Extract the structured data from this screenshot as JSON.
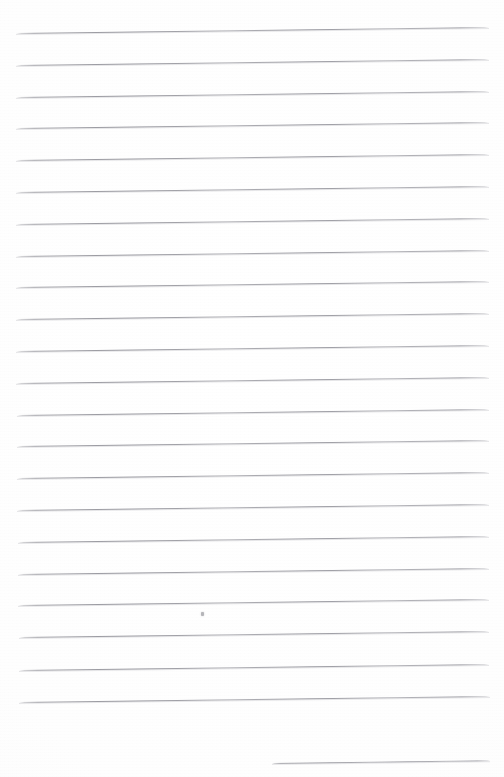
{
  "document": {
    "kind": "scanned-ruled-notebook-page",
    "title": "Blank lined notebook page",
    "description": "Scanned sheet of blank ruled (lined) notebook paper with no handwriting or printed text.",
    "page_width": 504,
    "page_height": 777,
    "background_color": "#ffffff",
    "paper_tone_color": "#fafafa",
    "has_text_content": false,
    "visible_text": ""
  },
  "ruling": {
    "rule_color": "#a9a9ae",
    "rule_color_dark": "#96969d",
    "rule_thickness_px": 1,
    "line_spacing_px": 31.8,
    "skew_degrees": -0.72,
    "left_margin_x": 16,
    "right_margin_x": 489,
    "full_rule_count": 22,
    "partial_rule_count": 1,
    "first_rule_y": 33,
    "last_full_rule_y": 702,
    "lines": [
      {
        "index": 1,
        "x": 16,
        "y": 33.0,
        "width": 473,
        "type": "full"
      },
      {
        "index": 2,
        "x": 16,
        "y": 64.8,
        "width": 473,
        "type": "full"
      },
      {
        "index": 3,
        "x": 16,
        "y": 96.6,
        "width": 473,
        "type": "full"
      },
      {
        "index": 4,
        "x": 16,
        "y": 128.4,
        "width": 473,
        "type": "full"
      },
      {
        "index": 5,
        "x": 16,
        "y": 160.2,
        "width": 473,
        "type": "full"
      },
      {
        "index": 6,
        "x": 16,
        "y": 192.0,
        "width": 473,
        "type": "full"
      },
      {
        "index": 7,
        "x": 16,
        "y": 223.8,
        "width": 473,
        "type": "full"
      },
      {
        "index": 8,
        "x": 16,
        "y": 255.6,
        "width": 473,
        "type": "full"
      },
      {
        "index": 9,
        "x": 16,
        "y": 287.4,
        "width": 473,
        "type": "full"
      },
      {
        "index": 10,
        "x": 16,
        "y": 319.2,
        "width": 473,
        "type": "full"
      },
      {
        "index": 11,
        "x": 16,
        "y": 351.0,
        "width": 473,
        "type": "full"
      },
      {
        "index": 12,
        "x": 16,
        "y": 382.8,
        "width": 473,
        "type": "full"
      },
      {
        "index": 13,
        "x": 17,
        "y": 414.6,
        "width": 472,
        "type": "full"
      },
      {
        "index": 14,
        "x": 17,
        "y": 446.4,
        "width": 472,
        "type": "full"
      },
      {
        "index": 15,
        "x": 17,
        "y": 478.2,
        "width": 472,
        "type": "full"
      },
      {
        "index": 16,
        "x": 17,
        "y": 510.0,
        "width": 472,
        "type": "full"
      },
      {
        "index": 17,
        "x": 18,
        "y": 541.8,
        "width": 471,
        "type": "full"
      },
      {
        "index": 18,
        "x": 18,
        "y": 573.6,
        "width": 471,
        "type": "full"
      },
      {
        "index": 19,
        "x": 18,
        "y": 605.4,
        "width": 471,
        "type": "full"
      },
      {
        "index": 20,
        "x": 19,
        "y": 637.2,
        "width": 470,
        "type": "full"
      },
      {
        "index": 21,
        "x": 19,
        "y": 669.5,
        "width": 470,
        "type": "full"
      },
      {
        "index": 22,
        "x": 19,
        "y": 701.5,
        "width": 471,
        "type": "full"
      },
      {
        "index": 23,
        "x": 272,
        "y": 763.0,
        "width": 218,
        "type": "partial"
      }
    ]
  },
  "marks": [
    {
      "name": "stray-speck",
      "x": 201,
      "y": 612,
      "width": 3,
      "height": 4,
      "color": "#78788 0"
    }
  ]
}
